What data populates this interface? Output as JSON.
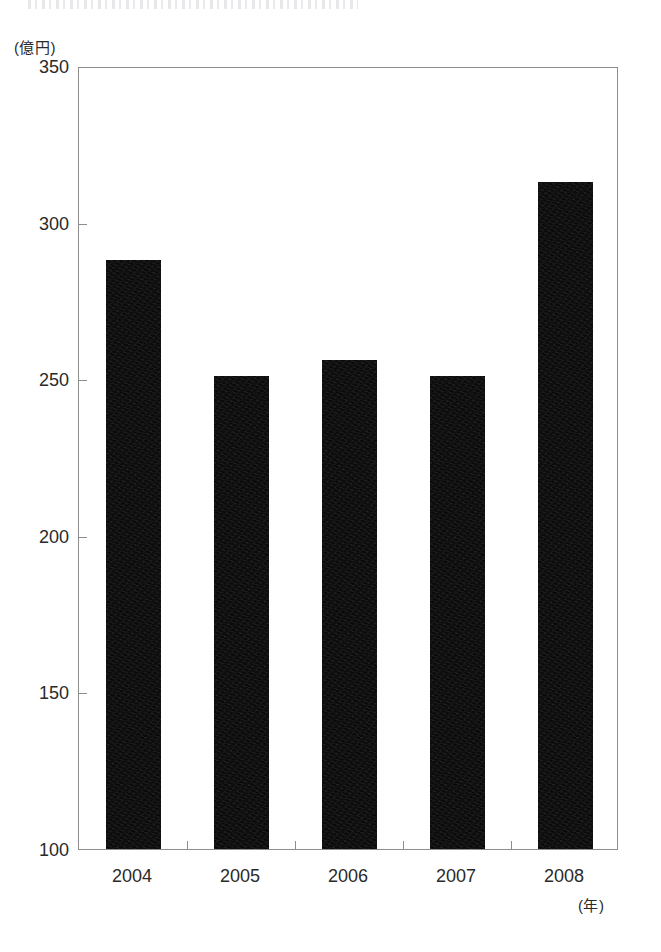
{
  "chart_data": {
    "type": "bar",
    "title": "",
    "subtitle": "",
    "xlabel": "(年)",
    "ylabel": "(億円)",
    "categories": [
      "2004",
      "2005",
      "2006",
      "2007",
      "2008"
    ],
    "values": [
      288,
      251,
      256,
      251,
      313
    ],
    "series": [
      {
        "name": "金額",
        "values": [
          288,
          251,
          256,
          251,
          313
        ]
      }
    ],
    "ylim": [
      100,
      350
    ],
    "yticks": [
      100,
      150,
      200,
      250,
      300,
      350
    ],
    "ytick_labels": [
      "100",
      "150",
      "200",
      "250",
      "300",
      "350"
    ],
    "grid": false,
    "legend": false,
    "legend_position": "none",
    "bar_color": "#0b0b0b",
    "axis_color": "#8d8d8d",
    "background_color": "#ffffff",
    "annotations": []
  },
  "axes": {
    "y_unit_label": "(億円)",
    "x_unit_label": "(年)"
  },
  "artifacts": {
    "top_scan_line": ""
  }
}
